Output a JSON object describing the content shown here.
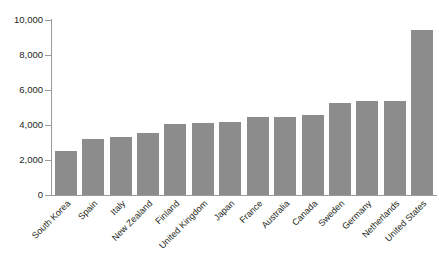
{
  "chart_data": {
    "type": "bar",
    "title": "",
    "subtitle": "",
    "xlabel": "",
    "ylabel": "",
    "categories": [
      "South Korea",
      "Spain",
      "Italy",
      "New Zealand",
      "Finland",
      "United Kingdom",
      "Japan",
      "France",
      "Australia",
      "Canada",
      "Sweden",
      "Germany",
      "Netherlands",
      "United States"
    ],
    "values": [
      2500,
      3200,
      3300,
      3550,
      4050,
      4100,
      4200,
      4450,
      4450,
      4600,
      5250,
      5350,
      5400,
      9450
    ],
    "ylim": [
      0,
      10000
    ],
    "ytick_values": [
      0,
      2000,
      4000,
      6000,
      8000,
      10000
    ],
    "ytick_labels": [
      "0",
      "2,000",
      "4,000",
      "6,000",
      "8,000",
      "10,000"
    ],
    "grid": false,
    "legend": null,
    "bar_color": "#8c8c8c",
    "axis_color": "#9a9a9a",
    "text_color": "#231f20",
    "background_color": "#ffffff"
  }
}
